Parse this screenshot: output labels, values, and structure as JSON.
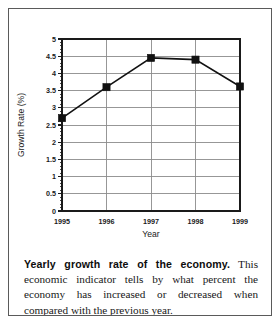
{
  "figure": {
    "caption_lead": "Yearly growth rate of the economy.",
    "caption_body": " This economic indicator tells by what percent the economy has increased or decreased when compared with the previous year."
  },
  "chart_data": {
    "type": "line",
    "title": "",
    "xlabel": "Year",
    "ylabel": "Growth Rate (%)",
    "categories": [
      "1995",
      "1996",
      "1997",
      "1998",
      "1999"
    ],
    "x": [
      1995,
      1996,
      1997,
      1998,
      1999
    ],
    "values": [
      2.7,
      3.6,
      4.45,
      4.4,
      3.62
    ],
    "series": [
      {
        "name": "Growth Rate",
        "values": [
          2.7,
          3.6,
          4.45,
          4.4,
          3.62
        ],
        "marker": "filled-square",
        "line_color": "#111111",
        "marker_color": "#111111"
      }
    ],
    "xlim": [
      1995,
      1999
    ],
    "ylim": [
      0,
      5
    ],
    "ytick_labels": [
      "0",
      "0.5",
      "1",
      "1.5",
      "2",
      "2.5",
      "3",
      "3.5",
      "4",
      "4.5",
      "5"
    ],
    "ytick_values": [
      0,
      0.5,
      1,
      1.5,
      2,
      2.5,
      3,
      3.5,
      4,
      4.5,
      5
    ],
    "xtick_labels": [
      "1995",
      "1996",
      "1997",
      "1998",
      "1999"
    ],
    "grid": "both",
    "grid_color": "#8c8c8c",
    "minor_ticks_axis": "y",
    "legend": "none",
    "axis_color": "#1a1a1a",
    "background": "#ffffff"
  }
}
